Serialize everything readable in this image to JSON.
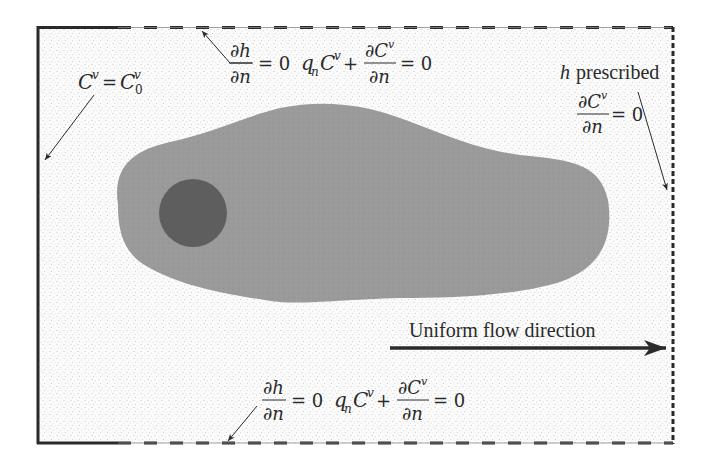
{
  "figure": {
    "colors": {
      "background": "#fbfbfb",
      "stipple": "#c9c9c9",
      "plume": "#999999",
      "source": "#5e5e5e",
      "line": "#2a2a2a"
    },
    "domain_box": {
      "left": 38,
      "top": 27,
      "right": 673,
      "bottom": 443
    },
    "labels": {
      "left_bc": {
        "lhs": "C",
        "lhs_sup": "v",
        "eq": "=",
        "rhs": "C",
        "rhs_sup": "v",
        "rhs_sub": "0"
      },
      "top_bc": {
        "frac1_num": "∂h",
        "frac1_den": "∂n",
        "eq1": "= 0",
        "term_q": "q",
        "term_q_sub": "n",
        "term_c": "C",
        "term_c_sup": "v",
        "plus": "+",
        "frac2_num": "∂C",
        "frac2_num_sup": "v",
        "frac2_den": "∂n",
        "eq2": "= 0"
      },
      "right_bc": {
        "h": "h",
        "prescribed": "prescribed",
        "frac_num": "∂C",
        "frac_num_sup": "v",
        "frac_den": "∂n",
        "eq": "= 0"
      },
      "bottom_bc": {
        "frac1_num": "∂h",
        "frac1_den": "∂n",
        "eq1": "= 0",
        "term_q": "q",
        "term_q_sub": "n",
        "term_c": "C",
        "term_c_sup": "v",
        "plus": "+",
        "frac2_num": "∂C",
        "frac2_num_sup": "v",
        "frac2_den": "∂n",
        "eq2": "= 0"
      },
      "flow": "Uniform flow direction"
    }
  }
}
